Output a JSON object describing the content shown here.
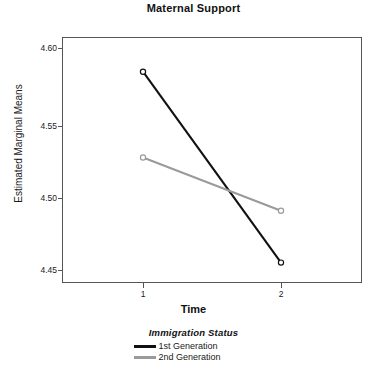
{
  "chart_data": {
    "type": "line",
    "title": "Maternal Support",
    "xlabel": "Time",
    "ylabel": "Estimated Marginal Means",
    "x": [
      1,
      2
    ],
    "xticklabels": [
      "1",
      "2"
    ],
    "yticklabels": [
      "4.60",
      "4.55",
      "4.50",
      "4.45"
    ],
    "yticks": [
      4.6,
      4.55,
      4.5,
      4.45
    ],
    "ylim": [
      4.4315,
      4.6095
    ],
    "xlim": [
      0.41,
      1.59
    ],
    "grid": false,
    "legend_position": "bottom-center",
    "legend_title": "Immigration Status",
    "series": [
      {
        "name": "1st Generation",
        "color": "#111111",
        "values": [
          4.584,
          4.455
        ],
        "marker": "circle"
      },
      {
        "name": "2nd Generation",
        "color": "#9a9a9a",
        "values": [
          4.526,
          4.49
        ],
        "marker": "circle"
      }
    ]
  },
  "axes": {
    "ticks_y": [
      {
        "label": "4.60",
        "top": 48
      },
      {
        "label": "4.55",
        "top": 126
      },
      {
        "label": "4.50",
        "top": 198
      },
      {
        "label": "4.45",
        "top": 270
      }
    ],
    "ticks_x": [
      {
        "label": "1",
        "left": 143
      },
      {
        "label": "2",
        "left": 281
      }
    ]
  },
  "colors": {
    "series_1": "#111111",
    "series_2": "#9a9a9a",
    "frame": "#555555",
    "background": "#ffffff"
  }
}
